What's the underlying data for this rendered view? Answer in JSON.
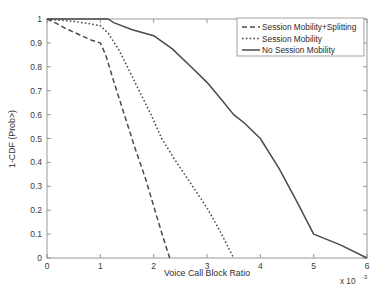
{
  "chart_data": {
    "type": "line",
    "title": "",
    "xlabel": "Voice Call Block Ratio",
    "ylabel": "1-CDF (Prob>)",
    "x_exponent_prefix": "x 10",
    "x_exponent_value": "-3",
    "xlim": [
      0,
      6
    ],
    "ylim": [
      0,
      1
    ],
    "grid": false,
    "xticks": [
      "0",
      "1",
      "2",
      "3",
      "4",
      "5",
      "6"
    ],
    "xtick_values": [
      0,
      1,
      2,
      3,
      4,
      5,
      6
    ],
    "yticks": [
      "0",
      "0.1",
      "0.2",
      "0.3",
      "0.4",
      "0.5",
      "0.6",
      "0.7",
      "0.8",
      "0.9",
      "1"
    ],
    "ytick_values": [
      0,
      0.1,
      0.2,
      0.3,
      0.4,
      0.5,
      0.6,
      0.7,
      0.8,
      0.9,
      1
    ],
    "legend_position": "top-right",
    "series": [
      {
        "name": "Session Mobility+Splitting",
        "style": "dashed",
        "dash_pattern": "5,3",
        "color": "#4a4a4a",
        "x": [
          0.0,
          0.15,
          0.35,
          0.6,
          0.85,
          1.0,
          1.1,
          1.25,
          1.45,
          1.65,
          1.85,
          2.05,
          2.2,
          2.3
        ],
        "y": [
          1.0,
          0.985,
          0.96,
          0.935,
          0.91,
          0.9,
          0.85,
          0.74,
          0.6,
          0.46,
          0.33,
          0.18,
          0.07,
          0.0
        ]
      },
      {
        "name": "Session Mobility",
        "style": "dotted",
        "dash_pattern": "1.6,2.2",
        "color": "#4a4a4a",
        "x": [
          0.0,
          0.25,
          0.5,
          0.75,
          1.0,
          1.15,
          1.35,
          1.55,
          1.75,
          1.95,
          2.15,
          2.4,
          2.7,
          3.0,
          3.25,
          3.5
        ],
        "y": [
          1.0,
          0.995,
          0.99,
          0.982,
          0.972,
          0.94,
          0.87,
          0.78,
          0.69,
          0.6,
          0.5,
          0.41,
          0.31,
          0.21,
          0.11,
          0.0
        ]
      },
      {
        "name": "No Session Mobility",
        "style": "solid",
        "dash_pattern": "none",
        "color": "#4a4a4a",
        "x": [
          0.0,
          0.6,
          1.15,
          1.25,
          1.6,
          2.0,
          2.35,
          2.7,
          3.0,
          3.3,
          3.5,
          3.7,
          4.0,
          4.35,
          4.7,
          5.0,
          5.5,
          6.0
        ],
        "y": [
          1.0,
          1.0,
          1.0,
          0.985,
          0.955,
          0.93,
          0.875,
          0.8,
          0.735,
          0.655,
          0.6,
          0.565,
          0.5,
          0.375,
          0.23,
          0.1,
          0.055,
          0.0
        ]
      }
    ]
  },
  "legend": {
    "entries": [
      {
        "label": "Session Mobility+Splitting",
        "style": "dashed"
      },
      {
        "label": "Session Mobility",
        "style": "dotted"
      },
      {
        "label": "No Session Mobility",
        "style": "solid"
      }
    ]
  }
}
